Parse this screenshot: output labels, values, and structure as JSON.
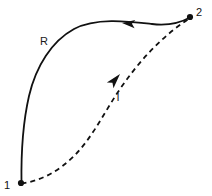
{
  "diagram": {
    "title": "",
    "background_color": "#ffffff",
    "stroke_color": "#111111",
    "states": [
      {
        "id": "state-1",
        "label": "1",
        "point": {
          "x": 21,
          "y": 183
        },
        "label_pos": {
          "x": 7,
          "y": 189
        },
        "marker": "filled-dot"
      },
      {
        "id": "state-2",
        "label": "2",
        "point": {
          "x": 190,
          "y": 17
        },
        "label_pos": {
          "x": 196,
          "y": 15
        },
        "marker": "filled-dot"
      }
    ],
    "paths": [
      {
        "id": "path-reversible",
        "label": "R",
        "style": "solid",
        "color": "#111111",
        "width": 1.8,
        "direction": "from-2-to-1",
        "label_pos": {
          "x": 41,
          "y": 45
        },
        "arrow_pos": {
          "x": 122,
          "y": 23
        },
        "arrow_angle_deg": 185,
        "d": "M 21.5 183 C 21.0 150 23.5 120 29 96 C 36 66 52 41 74 29 C 96 17 130 21.5 152 24 C 170 26 182 22 190 17.5"
      },
      {
        "id": "path-irreversible",
        "label": "I",
        "style": "dashed",
        "dash_pattern": "5 4",
        "color": "#111111",
        "width": 1.8,
        "direction": "from-1-to-2",
        "label_pos": {
          "x": 116,
          "y": 101
        },
        "arrow_pos": {
          "x": 120,
          "y": 74
        },
        "arrow_angle_deg": 311,
        "d": "M 21.5 183.5 C 40 181 58 172 74 156 C 92 138 104 113 118 92 C 138 62 162 36 190 18"
      }
    ]
  }
}
